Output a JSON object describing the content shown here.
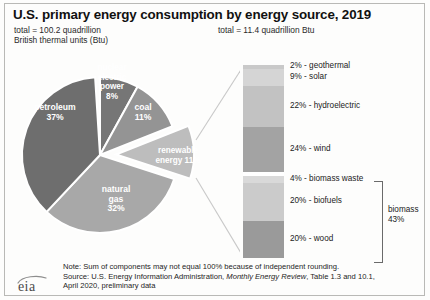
{
  "header": {
    "title": "U.S. primary energy consumption by energy source, 2019",
    "total_left_line1": "total = 100.2 quadrillion",
    "total_left_line2": "British thermal units (Btu)",
    "total_right": "total = 11.4 quadrillion Btu"
  },
  "chart_data": {
    "type": "pie",
    "title": "U.S. primary energy consumption by energy source, 2019",
    "total_label": "total = 100.2 quadrillion British thermal units (Btu)",
    "unit": "quadrillion Btu",
    "total_value": 100.2,
    "categories": [
      "petroleum",
      "natural gas",
      "coal",
      "renewable energy",
      "nuclear electric power"
    ],
    "values": [
      37,
      32,
      11,
      11,
      8
    ],
    "exploded": [
      "renewable energy"
    ],
    "labels": [
      {
        "name": "petroleum",
        "percent": "37%",
        "line1": "petroleum",
        "line2": "37%",
        "color": "#6e6e6e"
      },
      {
        "name": "natural-gas",
        "percent": "32%",
        "line1": "natural",
        "line2": "gas",
        "line3": "32%",
        "color": "#a8a8a8"
      },
      {
        "name": "coal",
        "percent": "11%",
        "line1": "coal",
        "line2": "11%",
        "color": "#949494"
      },
      {
        "name": "nuclear-electric-power",
        "percent": "8%",
        "line1": "nuclear",
        "line2": "electric",
        "line3": "power",
        "line4": "8%",
        "color": "#bdbdbd"
      },
      {
        "name": "renewable-energy",
        "percent": "11%",
        "line1": "renewable",
        "line2": "energy 11%",
        "color": "#767676"
      }
    ],
    "breakout": {
      "type": "bar",
      "orientation": "vertical-stacked",
      "title": "total = 11.4 quadrillion Btu",
      "total_value": 11.4,
      "group_label_line1": "biomass",
      "group_label_line2": "43%",
      "group_members": [
        "biomass waste",
        "biofuels",
        "wood"
      ],
      "segments": [
        {
          "label": "2% - geothermal",
          "name": "geothermal",
          "percent": 2,
          "color": "#c9c9c9",
          "gap_after": false
        },
        {
          "label": "9% - solar",
          "name": "solar",
          "percent": 9,
          "color": "#d5d5d5",
          "gap_after": false
        },
        {
          "label": "22% - hydroelectric",
          "name": "hydroelectric",
          "percent": 22,
          "color": "#c2c2c2",
          "gap_after": false
        },
        {
          "label": "24% - wind",
          "name": "wind",
          "percent": 24,
          "color": "#a3a3a3",
          "gap_after": true
        },
        {
          "label": "4% - biomass waste",
          "name": "biomass-waste",
          "percent": 4,
          "color": "#d9d9d9",
          "gap_after": false
        },
        {
          "label": "20% - biofuels",
          "name": "biofuels",
          "percent": 20,
          "color": "#cbcbcb",
          "gap_after": false
        },
        {
          "label": "20% - wood",
          "name": "wood",
          "percent": 20,
          "color": "#9a9a9a",
          "gap_after": false
        }
      ]
    }
  },
  "footer": {
    "note": "Note: Sum of components may not equal 100% because of independent rounding.",
    "source_pre": "Source: U.S. Energy Information Administration, ",
    "source_italic": "Monthly Energy Review",
    "source_post": ", Table 1.3 and 10.1,",
    "source_line2": "April 2020, preliminary data",
    "logo_text": "eia"
  },
  "colors": {
    "petroleum": "#6e6e6e",
    "natural_gas": "#a8a8a8",
    "coal": "#949494",
    "nuclear": "#bdbdbd",
    "renewable": "#767676",
    "frame": "#b9b9b6",
    "text": "#222222"
  }
}
